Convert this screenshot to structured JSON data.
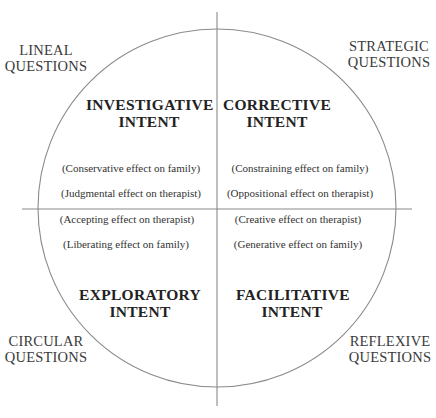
{
  "diagram": {
    "colors": {
      "line": "#8a8a8a",
      "text": "#2a2a2a",
      "background": "#ffffff"
    },
    "corners": {
      "top_left": {
        "line1": "LINEAL",
        "line2": "QUESTIONS"
      },
      "top_right": {
        "line1": "STRATEGIC",
        "line2": "QUESTIONS"
      },
      "bottom_left": {
        "line1": "CIRCULAR",
        "line2": "QUESTIONS"
      },
      "bottom_right": {
        "line1": "REFLEXIVE",
        "line2": "QUESTIONS"
      }
    },
    "quadrants": {
      "top_left": {
        "intent_line1": "INVESTIGATIVE",
        "intent_line2": "INTENT",
        "effect1": "(Conservative effect on family)",
        "effect2": "(Judgmental effect on therapist)"
      },
      "top_right": {
        "intent_line1": "CORRECTIVE",
        "intent_line2": "INTENT",
        "effect1": "(Constraining effect on family)",
        "effect2": "(Oppositional effect on therapist)"
      },
      "bottom_left": {
        "intent_line1": "EXPLORATORY",
        "intent_line2": "INTENT",
        "effect1": "(Accepting effect on therapist)",
        "effect2": "(Liberating effect on family)"
      },
      "bottom_right": {
        "intent_line1": "FACILITATIVE",
        "intent_line2": "INTENT",
        "effect1": "(Creative effect on therapist)",
        "effect2": "(Generative effect on family)"
      }
    }
  }
}
